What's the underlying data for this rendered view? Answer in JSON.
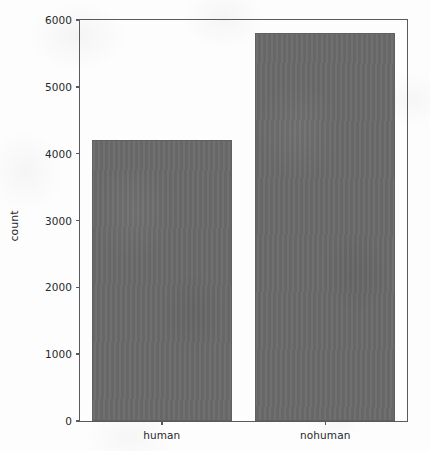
{
  "chart_data": {
    "type": "bar",
    "title": "",
    "xlabel": "",
    "ylabel": "count",
    "categories": [
      "human",
      "nohuman"
    ],
    "values": [
      4200,
      5800
    ],
    "series": [
      {
        "name": "count",
        "values": [
          4200,
          5800
        ]
      }
    ],
    "ylim": [
      0,
      6000
    ],
    "yticks": [
      0,
      1000,
      2000,
      3000,
      4000,
      5000,
      6000
    ],
    "yticklabels": [
      "0",
      "1000",
      "2000",
      "3000",
      "4000",
      "5000",
      "6000"
    ],
    "xticklabels": [
      "human",
      "nohuman"
    ],
    "grid": false,
    "legend": false,
    "bar_color": "#6b6b6b",
    "edge_color": "#5e6164",
    "axes_color": "#555b5e",
    "background_color": "#fdfdfd",
    "text_color": "#26292b"
  }
}
